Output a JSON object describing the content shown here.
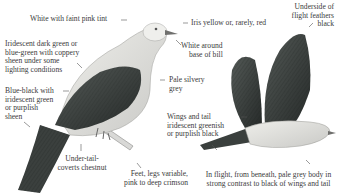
{
  "figure": {
    "perched_bird_labels": {
      "head": "White with faint pink tint",
      "neck_1": "Iridescent dark green or",
      "neck_2": "blue-green with coppery",
      "neck_3": "sheen under some",
      "neck_4": "lighting conditions",
      "wing_1": "Blue-black with",
      "wing_2": "iridescent green",
      "wing_3": "or purplish",
      "wing_4": "sheen",
      "undertail_1": "Under-tail-",
      "undertail_2": "coverts chestnut",
      "feet_1": "Feet, legs variable,",
      "feet_2": "pink to deep crimson",
      "iris": "Iris yellow or, rarely, red",
      "bill_1": "White around",
      "bill_2": "base of bill",
      "body_1": "Pale silvery",
      "body_2": "grey"
    },
    "flying_bird_labels": {
      "underwing_1": "Underside of",
      "underwing_2": "flight feathers",
      "underwing_3": "black",
      "wings_1": "Wings and tail",
      "wings_2": "iridescent greenish",
      "wings_3": "or purplish black",
      "flight_1": "In flight, from beneath, pale grey body in",
      "flight_2": "strong contrast to black of wings and tail"
    },
    "colors": {
      "background": "#ffffff",
      "text": "#3b3b3b",
      "dark_plumage": "#2f3432",
      "pale_body": "#dcdcd8",
      "head_white": "#ededea"
    }
  }
}
